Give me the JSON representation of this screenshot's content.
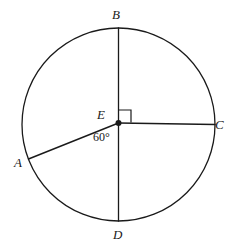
{
  "figure": {
    "kind": "circle-with-radii-diagram",
    "width": 240,
    "height": 251,
    "background_color": "#ffffff",
    "stroke_color": "#1a1a1a",
    "text_color": "#1a1a1a"
  },
  "circle": {
    "center_label": "E",
    "center_x": 118.5,
    "center_y": 124.5,
    "radius": 96.5,
    "stroke_width": 1.3
  },
  "points": {
    "A": {
      "label": "A",
      "x": 28.5,
      "y": 159.0
    },
    "B": {
      "label": "B",
      "x": 118.5,
      "y": 28.0
    },
    "C": {
      "label": "C",
      "x": 215.0,
      "y": 124.5
    },
    "D": {
      "label": "D",
      "x": 118.5,
      "y": 221.0
    },
    "E": {
      "label": "E",
      "x": 118.5,
      "y": 123.0
    }
  },
  "radii": [
    {
      "name": "EB",
      "from": "E",
      "to": "B"
    },
    {
      "name": "EC",
      "from": "E",
      "to": "C"
    },
    {
      "name": "ED",
      "from": "E",
      "to": "D"
    },
    {
      "name": "EA",
      "from": "E",
      "to": "A"
    }
  ],
  "angles": {
    "AED": {
      "value_text": "60°",
      "degrees": 60,
      "between": [
        "EA",
        "ED"
      ]
    },
    "BEC": {
      "marker": "right-angle-square",
      "degrees": 90,
      "between": [
        "EB",
        "EC"
      ]
    }
  },
  "right_angle_marker": {
    "x": 118.5,
    "y": 110.0,
    "size": 12.5
  },
  "center_dot": {
    "radius": 3.0,
    "color": "#1a1a1a"
  }
}
